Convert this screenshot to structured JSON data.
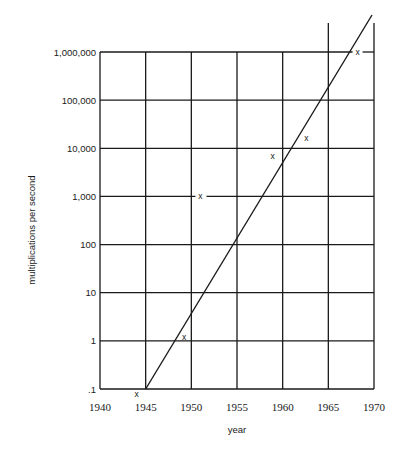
{
  "chart_data": {
    "type": "scatter",
    "title": "",
    "xlabel": "year",
    "ylabel": "multiplications per second",
    "yscale": "log",
    "xlim": [
      1940,
      1970
    ],
    "ylim": [
      0.1,
      1000000
    ],
    "grid": true,
    "x_ticks": [
      "1940",
      "1945",
      "1950",
      "1955",
      "1960",
      "1965",
      "1970"
    ],
    "y_ticks": [
      ".1",
      "1",
      "10",
      "100",
      "1,000",
      "10,000",
      "100,000",
      "1,000,000"
    ],
    "series": [
      {
        "name": "computers",
        "marker": "x",
        "points": [
          {
            "x": 1944.0,
            "y": 0.08
          },
          {
            "x": 1949.2,
            "y": 1.2
          },
          {
            "x": 1951.0,
            "y": 1000
          },
          {
            "x": 1958.9,
            "y": 6800
          },
          {
            "x": 1962.6,
            "y": 16000
          },
          {
            "x": 1968.2,
            "y": 1000000
          }
        ]
      },
      {
        "name": "trend",
        "type": "line",
        "points": [
          {
            "x": 1945,
            "y": 0.1
          },
          {
            "x": 1969.7,
            "y": 50000000
          }
        ]
      }
    ],
    "legend": null
  },
  "markers": {
    "symbol": "x"
  }
}
